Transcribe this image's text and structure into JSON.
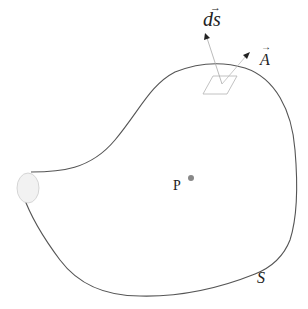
{
  "diagram": {
    "labels": {
      "ds": "ds",
      "ds_arrow": "→",
      "A": "A",
      "A_arrow": "→",
      "P": "P",
      "S": "S"
    },
    "elements": {
      "surface": "closed-surface-S",
      "opening": "elliptical-opening",
      "patch": "area-element-patch",
      "normal_vector": "ds-vector",
      "field_vector": "A-vector",
      "point": "point-P"
    },
    "colors": {
      "curve": "#555555",
      "patch": "#bbbbbb",
      "vector_ds": "#aaaaaa",
      "vector_A": "#bbbbbb",
      "point": "#888888",
      "opening_fill": "#f2f2f2",
      "opening_stroke": "#cccccc"
    }
  }
}
